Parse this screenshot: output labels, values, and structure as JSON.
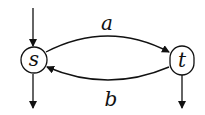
{
  "diagram": {
    "nodes": [
      {
        "id": "s",
        "label": "s"
      },
      {
        "id": "t",
        "label": "t"
      }
    ],
    "edges": [
      {
        "from": "s",
        "to": "t",
        "label": "a"
      },
      {
        "from": "t",
        "to": "s",
        "label": "b"
      }
    ],
    "initial": [
      "s"
    ],
    "final": [
      "s",
      "t"
    ]
  }
}
